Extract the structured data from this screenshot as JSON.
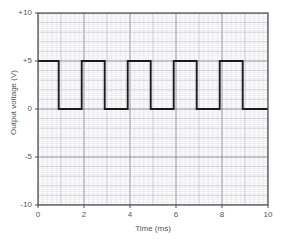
{
  "chart_data": {
    "type": "line",
    "title": "",
    "xlabel": "Time (ms)",
    "ylabel": "Output voltage (V)",
    "xlim": [
      0,
      10
    ],
    "ylim": [
      -10,
      10
    ],
    "xticks": [
      0,
      2,
      4,
      6,
      8,
      10
    ],
    "xtick_labels": [
      "0",
      "2",
      "4",
      "6",
      "8",
      "10"
    ],
    "yticks": [
      10,
      5,
      0,
      -5,
      -10
    ],
    "ytick_labels": [
      "+10",
      "+5",
      "0",
      "-5",
      "-10"
    ],
    "grid": true,
    "grid_major_step_x": 1,
    "grid_major_step_y": 1,
    "grid_minor_per_major": 5,
    "legend": "none",
    "series": [
      {
        "name": "Output voltage",
        "waveform": "square",
        "high_value": 5,
        "low_value": 0,
        "period_ms": 2,
        "duty_cycle_pct": 45,
        "x": [
          0,
          0.9,
          0.9,
          1.9,
          1.9,
          2.9,
          2.9,
          3.9,
          3.9,
          4.9,
          4.9,
          5.9,
          5.9,
          6.9,
          6.9,
          7.9,
          7.9,
          8.9,
          8.9,
          10
        ],
        "y": [
          5,
          5,
          0,
          0,
          5,
          5,
          0,
          0,
          5,
          5,
          0,
          0,
          5,
          5,
          0,
          0,
          5,
          5,
          0,
          0
        ]
      }
    ]
  },
  "style": {
    "trace_color": "#1c1c1c",
    "axis_color": "#4a4a4a",
    "grid_major_color": "#b9b9c4",
    "grid_minor_color": "#dedee6",
    "background": "#ffffff",
    "tick_text_color": "#555555"
  }
}
